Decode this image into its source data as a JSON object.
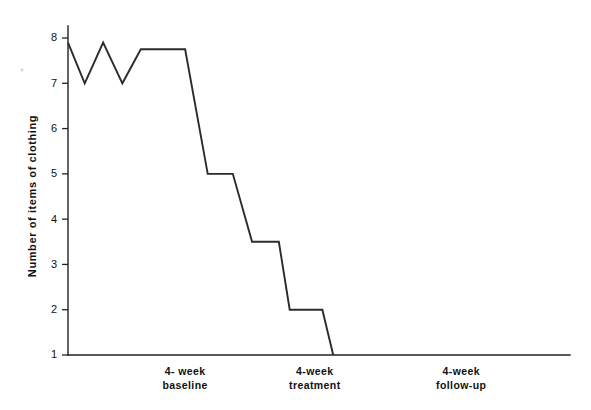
{
  "chart_data": {
    "type": "line",
    "title": "",
    "subtitle": "",
    "xlabel": "",
    "ylabel": "Number of items of clothing",
    "ylim": [
      1,
      8
    ],
    "yticks": [
      1,
      2,
      3,
      4,
      5,
      6,
      7,
      8
    ],
    "ytick_labels": [
      "1",
      "2",
      "3",
      "4",
      "5",
      "6",
      "7",
      "8"
    ],
    "xlim": [
      0,
      12
    ],
    "grid": false,
    "legend": false,
    "legend_position": "none",
    "line_color": "#2b2b2b",
    "axis_color": "#222222",
    "background": "#ffffff",
    "annotations": [],
    "phases": [
      {
        "name": "4- week baseline",
        "line1": "4- week",
        "line2": "baseline",
        "center_x": 2.8
      },
      {
        "name": "4-week treatment",
        "line1": "4-week",
        "line2": "treatment",
        "center_x": 5.9
      },
      {
        "name": "4-week follow-up",
        "line1": "4-week",
        "line2": "follow-up",
        "center_x": 9.4
      }
    ],
    "series": [
      {
        "name": "Items of clothing worn",
        "points": [
          {
            "x": 0.0,
            "y": 7.9
          },
          {
            "x": 0.4,
            "y": 7.0
          },
          {
            "x": 0.84,
            "y": 7.9
          },
          {
            "x": 1.3,
            "y": 7.0
          },
          {
            "x": 1.74,
            "y": 7.75
          },
          {
            "x": 2.8,
            "y": 7.75
          },
          {
            "x": 3.34,
            "y": 5.0
          },
          {
            "x": 3.94,
            "y": 5.0
          },
          {
            "x": 4.4,
            "y": 3.5
          },
          {
            "x": 5.04,
            "y": 3.5
          },
          {
            "x": 5.3,
            "y": 2.0
          },
          {
            "x": 6.08,
            "y": 2.0
          },
          {
            "x": 6.34,
            "y": 1.0
          }
        ]
      }
    ]
  }
}
